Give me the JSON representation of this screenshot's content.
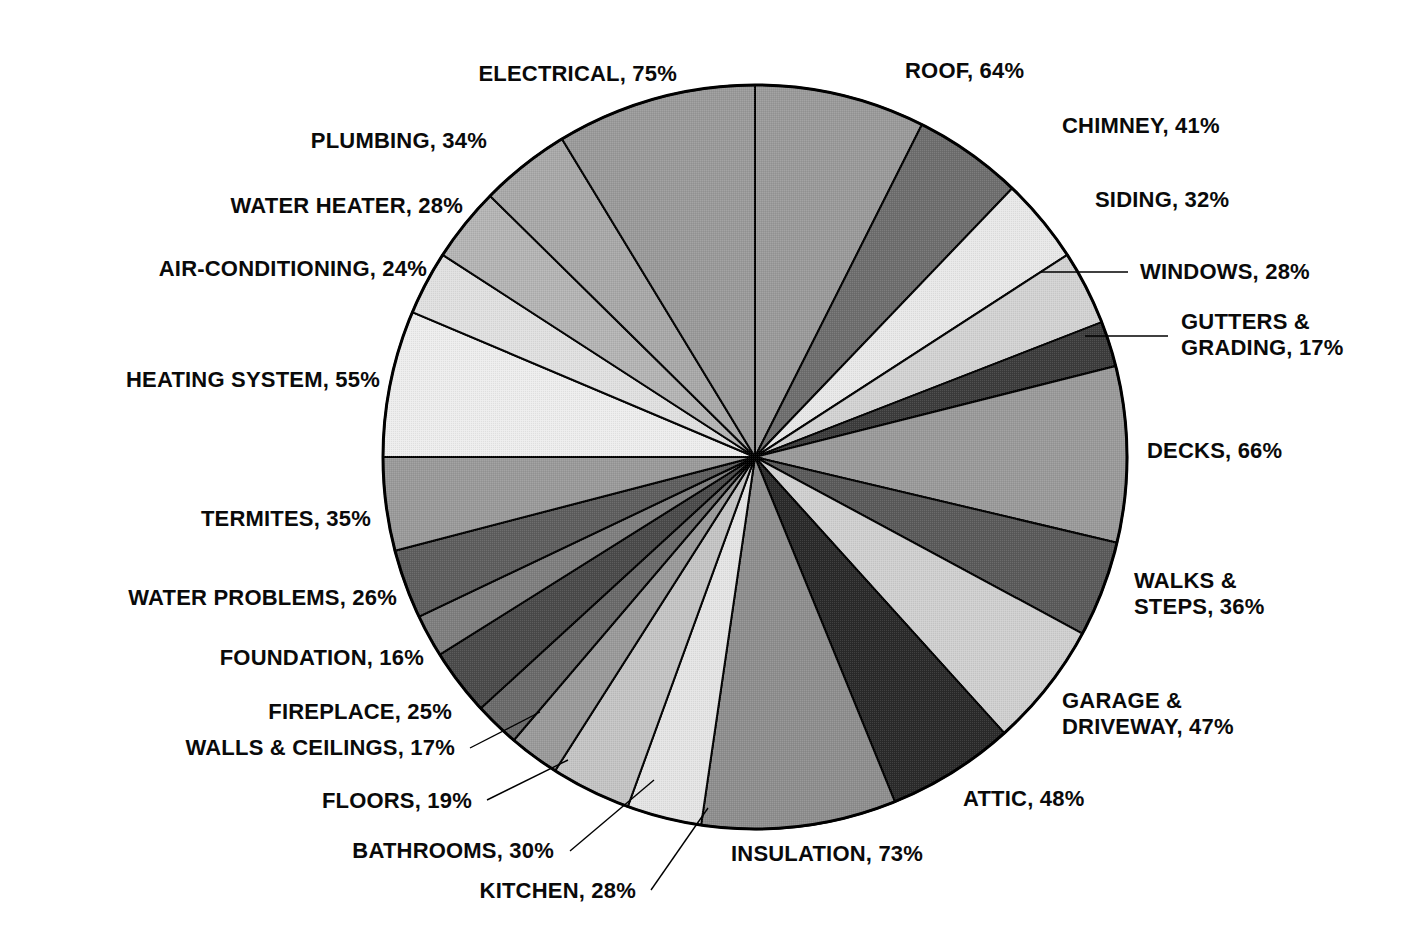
{
  "chart_data": {
    "type": "pie",
    "title": "",
    "subtitle": "",
    "xlabel": "",
    "ylabel": "",
    "legend_position": "outside-labels",
    "grid": false,
    "value_suffix": "%",
    "label_format": "NAME, VALUE%",
    "start_angle_deg": 0,
    "direction": "clockwise",
    "categories": [
      "ROOF",
      "CHIMNEY",
      "SIDING",
      "WINDOWS",
      "GUTTERS & GRADING",
      "DECKS",
      "WALKS & STEPS",
      "GARAGE & DRIVEWAY",
      "ATTIC",
      "INSULATION",
      "KITCHEN",
      "BATHROOMS",
      "FLOORS",
      "WALLS & CEILINGS",
      "FIREPLACE",
      "FOUNDATION",
      "WATER PROBLEMS",
      "TERMITES",
      "HEATING SYSTEM",
      "AIR-CONDITIONING",
      "WATER HEATER",
      "PLUMBING",
      "ELECTRICAL"
    ],
    "values": [
      64,
      41,
      32,
      28,
      17,
      66,
      36,
      47,
      48,
      73,
      28,
      30,
      19,
      17,
      25,
      16,
      26,
      35,
      55,
      24,
      28,
      34,
      75
    ],
    "slice_colors": [
      "#9a9a9a",
      "#6e6e6e",
      "#e8e8e8",
      "#d2d2d2",
      "#3c3c3c",
      "#9a9a9a",
      "#5a5a5a",
      "#cfcfcf",
      "#2a2a2a",
      "#8e8e8e",
      "#e4e4e4",
      "#c4c4c4",
      "#9a9a9a",
      "#6a6a6a",
      "#4a4a4a",
      "#7e7e7e",
      "#5e5e5e",
      "#9a9a9a",
      "#ededed",
      "#e0e0e0",
      "#b4b4b4",
      "#a8a8a8",
      "#9a9a9a"
    ],
    "slice_stroke": "#000000",
    "background": "#ffffff",
    "total": 790
  },
  "labels": [
    {
      "name": "roof",
      "text": "ROOF, 64%",
      "lines": [
        "ROOF, 64%"
      ],
      "value": 64,
      "category": "ROOF"
    },
    {
      "name": "chimney",
      "text": "CHIMNEY, 41%",
      "lines": [
        "CHIMNEY, 41%"
      ],
      "value": 41,
      "category": "CHIMNEY"
    },
    {
      "name": "siding",
      "text": "SIDING, 32%",
      "lines": [
        "SIDING, 32%"
      ],
      "value": 32,
      "category": "SIDING"
    },
    {
      "name": "windows",
      "text": "WINDOWS, 28%",
      "lines": [
        "WINDOWS, 28%"
      ],
      "value": 28,
      "category": "WINDOWS"
    },
    {
      "name": "gutters-grading",
      "text": "GUTTERS & GRADING, 17%",
      "lines": [
        "GUTTERS &",
        "GRADING, 17%"
      ],
      "value": 17,
      "category": "GUTTERS & GRADING"
    },
    {
      "name": "decks",
      "text": "DECKS, 66%",
      "lines": [
        "DECKS, 66%"
      ],
      "value": 66,
      "category": "DECKS"
    },
    {
      "name": "walks-steps",
      "text": "WALKS & STEPS, 36%",
      "lines": [
        "WALKS &",
        "STEPS, 36%"
      ],
      "value": 36,
      "category": "WALKS & STEPS"
    },
    {
      "name": "garage-driveway",
      "text": "GARAGE & DRIVEWAY, 47%",
      "lines": [
        "GARAGE &",
        "DRIVEWAY, 47%"
      ],
      "value": 47,
      "category": "GARAGE & DRIVEWAY"
    },
    {
      "name": "attic",
      "text": "ATTIC, 48%",
      "lines": [
        "ATTIC, 48%"
      ],
      "value": 48,
      "category": "ATTIC"
    },
    {
      "name": "insulation",
      "text": "INSULATION, 73%",
      "lines": [
        "INSULATION, 73%"
      ],
      "value": 73,
      "category": "INSULATION"
    },
    {
      "name": "kitchen",
      "text": "KITCHEN, 28%",
      "lines": [
        "KITCHEN, 28%"
      ],
      "value": 28,
      "category": "KITCHEN"
    },
    {
      "name": "bathrooms",
      "text": "BATHROOMS, 30%",
      "lines": [
        "BATHROOMS, 30%"
      ],
      "value": 30,
      "category": "BATHROOMS"
    },
    {
      "name": "floors",
      "text": "FLOORS, 19%",
      "lines": [
        "FLOORS, 19%"
      ],
      "value": 19,
      "category": "FLOORS"
    },
    {
      "name": "walls-ceilings",
      "text": "WALLS & CEILINGS, 17%",
      "lines": [
        "WALLS & CEILINGS, 17%"
      ],
      "value": 17,
      "category": "WALLS & CEILINGS"
    },
    {
      "name": "fireplace",
      "text": "FIREPLACE, 25%",
      "lines": [
        "FIREPLACE, 25%"
      ],
      "value": 25,
      "category": "FIREPLACE"
    },
    {
      "name": "foundation",
      "text": "FOUNDATION, 16%",
      "lines": [
        "FOUNDATION, 16%"
      ],
      "value": 16,
      "category": "FOUNDATION"
    },
    {
      "name": "water-problems",
      "text": "WATER PROBLEMS, 26%",
      "lines": [
        "WATER PROBLEMS, 26%"
      ],
      "value": 26,
      "category": "WATER PROBLEMS"
    },
    {
      "name": "termites",
      "text": "TERMITES, 35%",
      "lines": [
        "TERMITES, 35%"
      ],
      "value": 35,
      "category": "TERMITES"
    },
    {
      "name": "heating-system",
      "text": "HEATING SYSTEM, 55%",
      "lines": [
        "HEATING SYSTEM, 55%"
      ],
      "value": 55,
      "category": "HEATING SYSTEM"
    },
    {
      "name": "air-conditioning",
      "text": "AIR-CONDITIONING, 24%",
      "lines": [
        "AIR-CONDITIONING, 24%"
      ],
      "value": 24,
      "category": "AIR-CONDITIONING"
    },
    {
      "name": "water-heater",
      "text": "WATER HEATER, 28%",
      "lines": [
        "WATER HEATER, 28%"
      ],
      "value": 28,
      "category": "WATER HEATER"
    },
    {
      "name": "plumbing",
      "text": "PLUMBING, 34%",
      "lines": [
        "PLUMBING, 34%"
      ],
      "value": 34,
      "category": "PLUMBING"
    },
    {
      "name": "electrical",
      "text": "ELECTRICAL, 75%",
      "lines": [
        "ELECTRICAL, 75%"
      ],
      "value": 75,
      "category": "ELECTRICAL"
    }
  ],
  "layout": {
    "center_x": 755,
    "center_y": 457,
    "radius": 372,
    "label_positions": [
      {
        "name": "roof",
        "x": 905,
        "y": 58,
        "align": "left"
      },
      {
        "name": "chimney",
        "x": 1062,
        "y": 113,
        "align": "left"
      },
      {
        "name": "siding",
        "x": 1095,
        "y": 187,
        "align": "left"
      },
      {
        "name": "windows",
        "x": 1140,
        "y": 259,
        "align": "left"
      },
      {
        "name": "gutters-grading",
        "x": 1181,
        "y": 309,
        "align": "left"
      },
      {
        "name": "decks",
        "x": 1147,
        "y": 438,
        "align": "left"
      },
      {
        "name": "walks-steps",
        "x": 1134,
        "y": 568,
        "align": "left"
      },
      {
        "name": "garage-driveway",
        "x": 1062,
        "y": 688,
        "align": "left"
      },
      {
        "name": "attic",
        "x": 963,
        "y": 786,
        "align": "left"
      },
      {
        "name": "insulation",
        "x": 731,
        "y": 841,
        "align": "left"
      },
      {
        "name": "kitchen",
        "x": 636,
        "y": 878,
        "align": "right"
      },
      {
        "name": "bathrooms",
        "x": 554,
        "y": 838,
        "align": "right"
      },
      {
        "name": "floors",
        "x": 472,
        "y": 788,
        "align": "right"
      },
      {
        "name": "walls-ceilings",
        "x": 455,
        "y": 735,
        "align": "right"
      },
      {
        "name": "fireplace",
        "x": 452,
        "y": 699,
        "align": "right"
      },
      {
        "name": "foundation",
        "x": 424,
        "y": 645,
        "align": "right"
      },
      {
        "name": "water-problems",
        "x": 397,
        "y": 585,
        "align": "right"
      },
      {
        "name": "termites",
        "x": 371,
        "y": 506,
        "align": "right"
      },
      {
        "name": "heating-system",
        "x": 380,
        "y": 367,
        "align": "right"
      },
      {
        "name": "air-conditioning",
        "x": 427,
        "y": 256,
        "align": "right"
      },
      {
        "name": "water-heater",
        "x": 463,
        "y": 193,
        "align": "right"
      },
      {
        "name": "plumbing",
        "x": 487,
        "y": 128,
        "align": "right"
      },
      {
        "name": "electrical",
        "x": 677,
        "y": 61,
        "align": "right"
      }
    ],
    "leader_lines": [
      {
        "name": "windows-leader",
        "x1": 1040,
        "y1": 272,
        "x2": 1128,
        "y2": 272
      },
      {
        "name": "gutters-grading-leader",
        "x1": 1085,
        "y1": 336,
        "x2": 1168,
        "y2": 336
      },
      {
        "name": "walls-ceilings-leader",
        "x1": 470,
        "y1": 748,
        "x2": 540,
        "y2": 712
      },
      {
        "name": "floors-leader",
        "x1": 487,
        "y1": 800,
        "x2": 568,
        "y2": 760
      },
      {
        "name": "bathrooms-leader",
        "x1": 570,
        "y1": 851,
        "x2": 654,
        "y2": 780
      },
      {
        "name": "kitchen-leader",
        "x1": 651,
        "y1": 890,
        "x2": 708,
        "y2": 808
      }
    ]
  }
}
